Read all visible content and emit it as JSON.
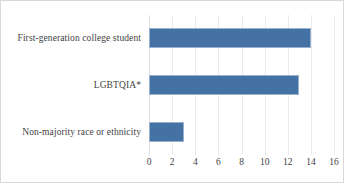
{
  "chart_data": {
    "type": "bar",
    "orientation": "horizontal",
    "title": "",
    "xlabel": "",
    "ylabel": "",
    "categories": [
      "First-generation college student",
      "LGBTQIA*",
      "Non-majority race or ethnicity"
    ],
    "values": [
      13,
      3,
      14
    ],
    "xlim": [
      0,
      16
    ],
    "xticks": [
      0,
      2,
      4,
      6,
      8,
      10,
      12,
      14,
      16
    ],
    "xtick_labels": [
      "0",
      "2",
      "4",
      "6",
      "8",
      "10",
      "12",
      "14",
      "16"
    ],
    "grid": true,
    "grid_axis": "x",
    "legend": false,
    "series": [
      {
        "name": "",
        "values": [
          13,
          3,
          14
        ],
        "color": "#4472a4"
      }
    ]
  },
  "style": {
    "bar_color": "#4472a4",
    "bar_border_color": "#9ab0cc",
    "gridline_color": "#e8eaed",
    "frame_color": "#d9d9d9",
    "text_color": "#3f3f3f",
    "background": "#ffffff"
  }
}
